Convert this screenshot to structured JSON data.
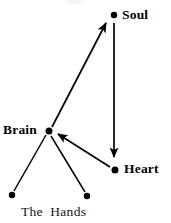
{
  "figure": {
    "type": "node-link-diagram",
    "background_color": "#ffffff",
    "ink_color": "#000000",
    "width": 171,
    "height": 223,
    "nodes": [
      {
        "id": "soul",
        "label": "Soul",
        "x": 114,
        "y": 15,
        "r": 3.2,
        "label_x": 122,
        "label_y": 9,
        "label_style": "bold"
      },
      {
        "id": "brain",
        "label": "Brain",
        "x": 49,
        "y": 131,
        "r": 3.4,
        "label_x": 3,
        "label_y": 124,
        "label_style": "bold"
      },
      {
        "id": "heart",
        "label": "Heart",
        "x": 115,
        "y": 170,
        "r": 3.4,
        "label_x": 124,
        "label_y": 163,
        "label_style": "bold"
      },
      {
        "id": "hand-left",
        "label": "",
        "x": 12,
        "y": 195,
        "r": 3.2,
        "label_x": 0,
        "label_y": 0,
        "label_style": "none"
      },
      {
        "id": "hand-right",
        "label": "",
        "x": 87,
        "y": 196,
        "r": 3.2,
        "label_x": 0,
        "label_y": 0,
        "label_style": "none"
      }
    ],
    "group_labels": [
      {
        "id": "the-hands",
        "label": "The  Hands",
        "x": 21,
        "y": 205
      }
    ],
    "edges": [
      {
        "id": "brain-to-soul",
        "from": "brain",
        "to": "soul",
        "x1": 52,
        "y1": 127,
        "x2": 106,
        "y2": 23,
        "arrow": "end",
        "stroke_width": 1.7
      },
      {
        "id": "soul-to-heart",
        "from": "soul",
        "to": "heart",
        "x1": 114,
        "y1": 23,
        "x2": 114,
        "y2": 159,
        "arrow": "end",
        "stroke_width": 1.7
      },
      {
        "id": "heart-to-brain",
        "from": "heart",
        "to": "brain",
        "x1": 110,
        "y1": 167,
        "x2": 57,
        "y2": 135,
        "arrow": "end",
        "stroke_width": 1.7
      },
      {
        "id": "brain-to-hand-left",
        "from": "brain",
        "to": "hand-left",
        "x1": 46,
        "y1": 135,
        "x2": 14,
        "y2": 191,
        "arrow": "none",
        "stroke_width": 1.5
      },
      {
        "id": "brain-to-hand-right",
        "from": "brain",
        "to": "hand-right",
        "x1": 51,
        "y1": 136,
        "x2": 85,
        "y2": 192,
        "arrow": "none",
        "stroke_width": 1.5
      }
    ]
  }
}
